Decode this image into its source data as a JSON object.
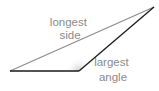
{
  "diagram": {
    "type": "obtuse-triangle",
    "labels": {
      "longest_side": [
        "longest",
        "side"
      ],
      "largest_angle": [
        "largest",
        "angle"
      ]
    },
    "vertices": {
      "left": [
        10,
        71
      ],
      "obtuse": [
        79,
        71
      ],
      "top_right": [
        154,
        7
      ]
    },
    "colors": {
      "longest_side": "#8c8c8c",
      "other_sides": "#1a1a1a",
      "angle_shade": "#d9d9d9",
      "label_text": "#8a8a8a"
    }
  }
}
